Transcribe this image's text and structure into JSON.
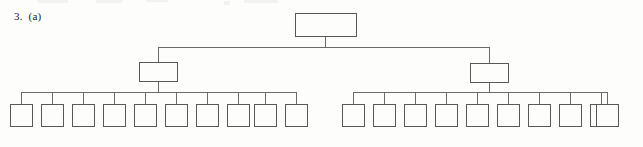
{
  "label": {
    "text": "3.  (a)"
  },
  "colors": {
    "page_background": "#fdfdfc",
    "node_fill": "#fdfdfc",
    "node_stroke": "#585858",
    "link_stroke": "#6a6a6a",
    "text": "#1c1c1c"
  },
  "diagram": {
    "type": "tree",
    "name": "empty-box-tree-diagram",
    "depth": 3,
    "levels": [
      {
        "level": 1,
        "name": "root-level",
        "node_count": 1,
        "nodes": [
          {
            "id": "root",
            "x": 295,
            "y": 13,
            "w": 61,
            "h": 23,
            "text": ""
          }
        ]
      },
      {
        "level": 2,
        "name": "branch-level",
        "node_count": 2,
        "nodes": [
          {
            "id": "branch-left",
            "x": 139,
            "y": 62,
            "w": 38,
            "h": 19,
            "text": ""
          },
          {
            "id": "branch-right",
            "x": 470,
            "y": 63,
            "w": 38,
            "h": 19,
            "text": ""
          }
        ]
      },
      {
        "level": 3,
        "name": "leaf-level",
        "node_count": 20,
        "leaf_size": {
          "w": 22,
          "h": 22
        },
        "groups": [
          {
            "id": "leaf-group-left",
            "parent": "branch-left",
            "count": 10,
            "y": 104,
            "bus_y": 92,
            "x_positions": [
              10,
              41,
              72,
              103,
              134,
              165,
              196,
              227,
              254,
              285
            ]
          },
          {
            "id": "leaf-group-right",
            "parent": "branch-right",
            "count": 10,
            "y": 104,
            "bus_y": 92,
            "x_positions": [
              342,
              373,
              404,
              435,
              466,
              497,
              528,
              559,
              590,
              596
            ]
          }
        ]
      }
    ],
    "connectors": {
      "root_stem_x": 325,
      "root_bus_y": 47,
      "root_bus_x1": 158,
      "root_bus_x2": 489
    }
  }
}
